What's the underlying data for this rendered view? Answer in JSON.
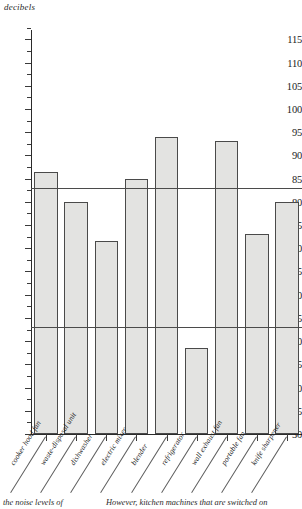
{
  "chart_data": {
    "type": "bar",
    "title": "",
    "ylabel": "decibels",
    "xlabel": "",
    "ylim": [
      30,
      117
    ],
    "ytick_step": 5,
    "grid": false,
    "legend": "none",
    "categories": [
      "cooker hood fan",
      "waste-disposal unit",
      "dishwasher",
      "electric mixer",
      "blender",
      "refrigerator",
      "wall exhaust fan",
      "portable fan",
      "knife sharpener"
    ],
    "values": [
      86.5,
      80,
      71.5,
      85,
      94,
      48.5,
      93,
      73,
      80
    ],
    "ytick_labels": [
      "115",
      "110",
      "105",
      "100",
      "95",
      "90",
      "85",
      "80",
      "75",
      "70",
      "65",
      "60",
      "55",
      "50",
      "45",
      "40",
      "35",
      "30"
    ],
    "ytick_values": [
      115,
      110,
      105,
      100,
      95,
      90,
      85,
      80,
      75,
      70,
      65,
      60,
      55,
      50,
      45,
      40,
      35,
      30
    ],
    "reference_lines": [
      {
        "name": "upper-threshold",
        "value": 83
      },
      {
        "name": "lower-threshold",
        "value": 53
      }
    ],
    "bar_fill_color": "#e3e3e1",
    "bar_edge_color": "#4a4a4a",
    "axis_color": "#2b2b2b"
  },
  "caption": {
    "left_text": "the noise levels of",
    "right_text": "However, kitchen machines that are switched on"
  }
}
